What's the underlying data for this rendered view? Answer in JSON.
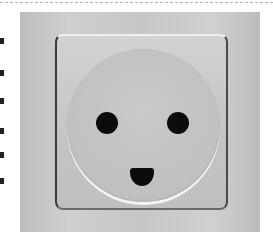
{
  "image": {
    "subject": "wall power outlet resembling a smiling face",
    "description": "Grey square wall socket plate with a circular recess containing two round holes and a D-shaped ground hole below, forming a face",
    "colors": {
      "background": "#c8c8c8",
      "holes": "#0c0c0c",
      "border_dash": "#b8b8b8"
    }
  }
}
